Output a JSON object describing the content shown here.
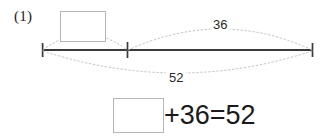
{
  "problem": {
    "number_label": "(1)",
    "type": "part-whole-number-line"
  },
  "diagram": {
    "segments": [
      {
        "name": "unknown-part",
        "label": "",
        "from_px": 42,
        "to_px": 127
      },
      {
        "name": "known-part",
        "label": "36",
        "from_px": 127,
        "to_px": 313
      },
      {
        "name": "whole",
        "label": "52",
        "from_px": 42,
        "to_px": 313
      }
    ],
    "upper_bracket_label": "36",
    "lower_bracket_label": "52",
    "unknown_box_value": "",
    "line_color": "#3a3a3a",
    "bracket_color": "#bdbdbd",
    "box_border_color": "#b6b6b6"
  },
  "equation": {
    "blank_value": "",
    "rest": "+36=52",
    "operand": "36",
    "result": "52",
    "operator": "+",
    "equals": "="
  }
}
